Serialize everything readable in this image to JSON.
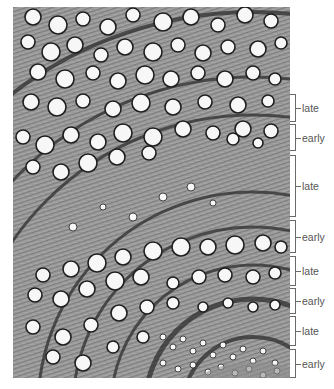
{
  "figure": {
    "image_box": {
      "x": 13,
      "y": 7,
      "w": 277,
      "h": 371
    },
    "colors": {
      "background": "#9a9a9a",
      "ray_light": "#bdbdbd",
      "ray_dark": "#6e6e6e",
      "ring_boundary": "#2e2e2e",
      "pore_fill": "#f7f7f7",
      "pore_rim": "#1e1e1e",
      "label_text": "#555555",
      "bracket_line": "#6a6a6a"
    },
    "ring_center": {
      "cx": 240,
      "cy": 400
    },
    "ring_boundaries": [
      {
        "r": 395,
        "w": 4
      },
      {
        "r": 330,
        "w": 3
      },
      {
        "r": 292,
        "w": 3
      },
      {
        "r": 215,
        "w": 3
      },
      {
        "r": 180,
        "w": 3
      },
      {
        "r": 142,
        "w": 3
      },
      {
        "r": 108,
        "w": 5
      },
      {
        "r": 70,
        "w": 4
      }
    ]
  },
  "labels": [
    {
      "text": "late",
      "top": 94,
      "bottom": 122
    },
    {
      "text": "early",
      "top": 124,
      "bottom": 151
    },
    {
      "text": "late",
      "top": 155,
      "bottom": 217
    },
    {
      "text": "early",
      "top": 220,
      "bottom": 253
    },
    {
      "text": "late",
      "top": 256,
      "bottom": 286
    },
    {
      "text": "early",
      "top": 288,
      "bottom": 314
    },
    {
      "text": "late",
      "top": 316,
      "bottom": 346
    },
    {
      "text": "early",
      "top": 349,
      "bottom": 378
    }
  ],
  "pores": [
    [
      20,
      10,
      8
    ],
    [
      45,
      18,
      9
    ],
    [
      70,
      12,
      7
    ],
    [
      95,
      20,
      8
    ],
    [
      120,
      8,
      7
    ],
    [
      150,
      15,
      9
    ],
    [
      178,
      10,
      8
    ],
    [
      205,
      18,
      7
    ],
    [
      232,
      8,
      8
    ],
    [
      258,
      14,
      7
    ],
    [
      15,
      35,
      7
    ],
    [
      38,
      45,
      9
    ],
    [
      62,
      38,
      8
    ],
    [
      88,
      48,
      7
    ],
    [
      112,
      40,
      8
    ],
    [
      140,
      45,
      9
    ],
    [
      165,
      38,
      7
    ],
    [
      190,
      46,
      8
    ],
    [
      215,
      40,
      7
    ],
    [
      245,
      42,
      8
    ],
    [
      268,
      36,
      6
    ],
    [
      25,
      65,
      8
    ],
    [
      52,
      72,
      9
    ],
    [
      80,
      66,
      7
    ],
    [
      105,
      74,
      8
    ],
    [
      132,
      68,
      9
    ],
    [
      158,
      72,
      8
    ],
    [
      185,
      66,
      7
    ],
    [
      212,
      72,
      8
    ],
    [
      240,
      66,
      7
    ],
    [
      262,
      72,
      6
    ],
    [
      18,
      95,
      8
    ],
    [
      44,
      100,
      9
    ],
    [
      70,
      94,
      7
    ],
    [
      100,
      102,
      8
    ],
    [
      128,
      96,
      9
    ],
    [
      160,
      100,
      8
    ],
    [
      192,
      95,
      7
    ],
    [
      225,
      98,
      8
    ],
    [
      255,
      94,
      6
    ],
    [
      10,
      130,
      7
    ],
    [
      32,
      138,
      9
    ],
    [
      58,
      128,
      8
    ],
    [
      85,
      135,
      8
    ],
    [
      110,
      126,
      9
    ],
    [
      140,
      130,
      9
    ],
    [
      170,
      122,
      8
    ],
    [
      200,
      126,
      7
    ],
    [
      230,
      122,
      8
    ],
    [
      258,
      124,
      7
    ],
    [
      20,
      160,
      7
    ],
    [
      48,
      165,
      8
    ],
    [
      75,
      156,
      9
    ],
    [
      104,
      150,
      8
    ],
    [
      136,
      146,
      7
    ],
    [
      220,
      132,
      6
    ],
    [
      245,
      136,
      5
    ],
    [
      150,
      190,
      4
    ],
    [
      178,
      180,
      4
    ],
    [
      200,
      196,
      3
    ],
    [
      120,
      210,
      4
    ],
    [
      90,
      200,
      3
    ],
    [
      60,
      220,
      4
    ],
    [
      30,
      268,
      7
    ],
    [
      58,
      262,
      8
    ],
    [
      84,
      256,
      9
    ],
    [
      110,
      250,
      8
    ],
    [
      140,
      244,
      9
    ],
    [
      168,
      240,
      9
    ],
    [
      195,
      240,
      8
    ],
    [
      222,
      238,
      9
    ],
    [
      250,
      236,
      8
    ],
    [
      268,
      240,
      6
    ],
    [
      22,
      288,
      7
    ],
    [
      48,
      292,
      8
    ],
    [
      74,
      282,
      8
    ],
    [
      102,
      274,
      9
    ],
    [
      128,
      270,
      8
    ],
    [
      160,
      276,
      6
    ],
    [
      186,
      270,
      7
    ],
    [
      212,
      268,
      7
    ],
    [
      240,
      270,
      7
    ],
    [
      262,
      266,
      6
    ],
    [
      20,
      320,
      7
    ],
    [
      50,
      330,
      8
    ],
    [
      78,
      318,
      7
    ],
    [
      106,
      306,
      8
    ],
    [
      134,
      300,
      7
    ],
    [
      160,
      296,
      6
    ],
    [
      190,
      300,
      5
    ],
    [
      215,
      296,
      5
    ],
    [
      240,
      300,
      5
    ],
    [
      262,
      298,
      5
    ],
    [
      40,
      350,
      7
    ],
    [
      70,
      356,
      8
    ],
    [
      100,
      340,
      6
    ],
    [
      130,
      330,
      6
    ],
    [
      150,
      330,
      3
    ],
    [
      160,
      340,
      3
    ],
    [
      170,
      332,
      3
    ],
    [
      180,
      344,
      3
    ],
    [
      190,
      336,
      3
    ],
    [
      200,
      348,
      3
    ],
    [
      210,
      338,
      3
    ],
    [
      220,
      350,
      3
    ],
    [
      230,
      342,
      3
    ],
    [
      240,
      354,
      3
    ],
    [
      250,
      344,
      3
    ],
    [
      262,
      356,
      3
    ],
    [
      150,
      356,
      3
    ],
    [
      165,
      362,
      3
    ],
    [
      180,
      358,
      3
    ],
    [
      195,
      365,
      3
    ],
    [
      208,
      360,
      3
    ],
    [
      222,
      366,
      3
    ],
    [
      236,
      362,
      3
    ],
    [
      250,
      368,
      3
    ],
    [
      264,
      364,
      3
    ]
  ]
}
